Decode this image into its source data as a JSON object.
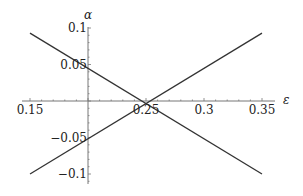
{
  "chart_data": {
    "type": "line",
    "title": "",
    "xlabel": "ε",
    "ylabel": "α",
    "xlim": [
      0.15,
      0.35
    ],
    "ylim": [
      -0.1,
      0.1
    ],
    "grid": false,
    "legend": null,
    "x_ticks": [
      "0.15",
      "0.25",
      "0.3",
      "0.35"
    ],
    "y_ticks": [
      "0.1",
      "0.05",
      "-0.05",
      "-0.1"
    ],
    "x_tick_values": [
      0.15,
      0.25,
      0.3,
      0.35
    ],
    "y_tick_values": [
      0.1,
      0.05,
      -0.05,
      -0.1
    ],
    "axes_origin": [
      0.2,
      0.0
    ],
    "series": [
      {
        "name": "decreasing",
        "x": [
          0.15,
          0.35
        ],
        "y": [
          0.093,
          -0.1
        ]
      },
      {
        "name": "increasing",
        "x": [
          0.15,
          0.35
        ],
        "y": [
          -0.1,
          0.093
        ]
      }
    ],
    "annotations": []
  },
  "colors": {
    "line": "#333333",
    "axis": "#777777",
    "text": "#222222"
  }
}
